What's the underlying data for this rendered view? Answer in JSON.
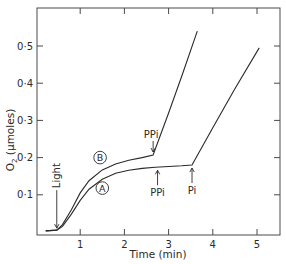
{
  "chart_data": {
    "type": "line",
    "title": "",
    "xlabel": "Time (min)",
    "ylabel": "O2 (µmoles)",
    "ylabel_parts": {
      "main": "O",
      "sub": "2",
      "rest": " (µmoles)"
    },
    "xlim": [
      0,
      5.6
    ],
    "ylim": [
      0,
      0.6
    ],
    "xticks": [
      1,
      2,
      3,
      4,
      5
    ],
    "xtick_labels": [
      "1",
      "2",
      "3",
      "4",
      "5"
    ],
    "yticks": [
      0.1,
      0.2,
      0.3,
      0.4,
      0.5
    ],
    "ytick_labels": [
      "0·1",
      "0·2",
      "0·3",
      "0·4",
      "0·5"
    ],
    "grid": false,
    "legend": "inline circled labels",
    "series": [
      {
        "name": "B",
        "x": [
          0.22,
          0.47,
          0.6,
          0.8,
          1.0,
          1.2,
          1.5,
          1.8,
          2.1,
          2.4,
          2.65,
          3.0,
          3.3,
          3.65
        ],
        "y": [
          0.003,
          0.005,
          0.02,
          0.06,
          0.105,
          0.138,
          0.167,
          0.183,
          0.193,
          0.2,
          0.207,
          0.32,
          0.42,
          0.54
        ]
      },
      {
        "name": "A",
        "x": [
          0.22,
          0.47,
          0.6,
          0.8,
          1.0,
          1.2,
          1.5,
          1.8,
          2.1,
          2.4,
          2.7,
          3.0,
          3.3,
          3.53,
          4.0,
          4.5,
          5.05
        ],
        "y": [
          0.003,
          0.005,
          0.015,
          0.048,
          0.085,
          0.115,
          0.142,
          0.158,
          0.166,
          0.171,
          0.174,
          0.176,
          0.178,
          0.18,
          0.28,
          0.385,
          0.495
        ]
      }
    ],
    "annotations": [
      {
        "text": "Light",
        "x": 0.47,
        "y": 0.005,
        "arrow": "down",
        "orientation": "vertical"
      },
      {
        "text": "PPi",
        "x": 2.65,
        "y": 0.207,
        "arrow": "down",
        "series": "B"
      },
      {
        "text": "PPi",
        "x": 2.75,
        "y": 0.174,
        "arrow": "up",
        "series": "A"
      },
      {
        "text": "Pi",
        "x": 3.53,
        "y": 0.18,
        "arrow": "up",
        "series": "A"
      }
    ],
    "series_labels": [
      {
        "text": "B",
        "x": 1.45,
        "y": 0.2
      },
      {
        "text": "A",
        "x": 1.5,
        "y": 0.118
      }
    ]
  }
}
